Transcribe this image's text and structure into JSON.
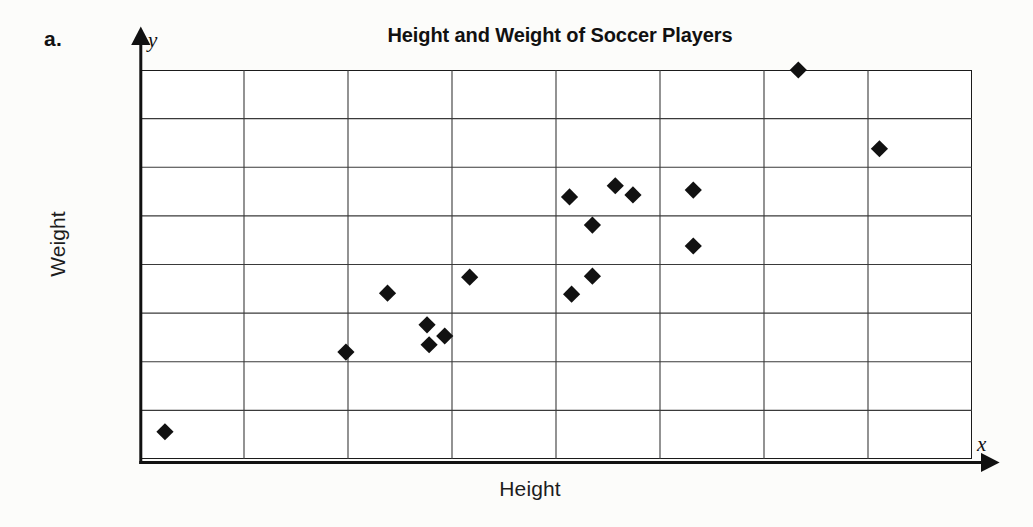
{
  "problem": {
    "label": "a."
  },
  "chart": {
    "title": "Height and Weight of Soccer Players",
    "x_axis_variable": "x",
    "y_axis_variable": "y",
    "x_axis_title": "Height",
    "y_axis_title": "Weight",
    "marker_shape": "diamond",
    "marker_color": "#111111",
    "grid_color": "#3a3a3a",
    "frame_color": "#1b1b1b"
  },
  "chart_data": {
    "type": "scatter",
    "title": "Height and Weight of Soccer Players",
    "xlabel": "Height",
    "ylabel": "Weight",
    "xlim": [
      0,
      8
    ],
    "ylim": [
      0,
      8
    ],
    "grid": true,
    "x_ticks": [
      0,
      1,
      2,
      3,
      4,
      5,
      6,
      7,
      8
    ],
    "y_ticks": [
      0,
      1,
      2,
      3,
      4,
      5,
      6,
      7,
      8
    ],
    "x_tick_labels": [],
    "y_tick_labels": [],
    "legend": null,
    "n_points": 17,
    "series": [
      {
        "name": "Soccer players",
        "marker": "diamond",
        "color": "#111111",
        "points": [
          [
            0.24,
            0.56
          ],
          [
            1.98,
            2.2
          ],
          [
            2.38,
            3.41
          ],
          [
            2.76,
            2.76
          ],
          [
            2.78,
            2.35
          ],
          [
            2.93,
            2.53
          ],
          [
            3.17,
            3.74
          ],
          [
            4.13,
            5.39
          ],
          [
            4.15,
            3.39
          ],
          [
            4.35,
            3.76
          ],
          [
            4.35,
            4.81
          ],
          [
            4.57,
            5.62
          ],
          [
            4.74,
            5.43
          ],
          [
            5.32,
            5.53
          ],
          [
            5.32,
            4.38
          ],
          [
            6.33,
            8.0
          ],
          [
            7.11,
            6.38
          ]
        ]
      }
    ]
  }
}
